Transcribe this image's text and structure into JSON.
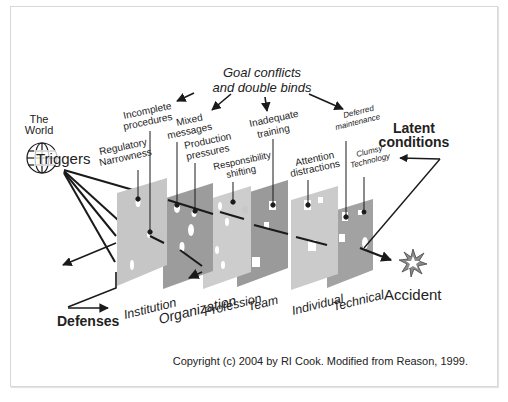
{
  "diagram": {
    "title_cause": {
      "line1": "Goal conflicts",
      "line2": "and double binds"
    },
    "world": {
      "line1": "The",
      "line2": "World",
      "triggers": "Triggers"
    },
    "latent": {
      "line1": "Latent",
      "line2": "conditions"
    },
    "defenses": "Defenses",
    "accident": "Accident",
    "copyright": "Copyright (c) 2004 by RI Cook. Modified from Reason, 1999.",
    "layers": [
      {
        "name": "Institution",
        "shade": "#c6c6c6"
      },
      {
        "name": "Organization",
        "shade": "#9c9c9c"
      },
      {
        "name": "Profession",
        "shade": "#cdcdcd"
      },
      {
        "name": "Team",
        "shade": "#9a9a9a"
      },
      {
        "name": "Individual",
        "shade": "#cbcbcb"
      },
      {
        "name": "Technical",
        "shade": "#a2a2a2"
      }
    ],
    "latent_labels": {
      "regulatory": {
        "line1": "Regulatory",
        "line2": "Narrowness"
      },
      "incomplete": {
        "line1": "Incomplete",
        "line2": "procedures"
      },
      "mixed": {
        "line1": "Mixed",
        "line2": "messages"
      },
      "production": {
        "line1": "Production",
        "line2": "pressures"
      },
      "responsibility": {
        "line1": "Responsibility",
        "line2": "shifting"
      },
      "inadequate": {
        "line1": "Inadequate",
        "line2": "training"
      },
      "attention": {
        "line1": "Attention",
        "line2": "distractions"
      },
      "deferred": {
        "line1": "Deferred",
        "line2": "maintenance"
      },
      "clumsy": {
        "line1": "Clumsy",
        "line2": "Technology"
      }
    },
    "colors": {
      "text": "#222222",
      "line": "#1a1a1a",
      "frame": "#d8d8d8"
    }
  }
}
